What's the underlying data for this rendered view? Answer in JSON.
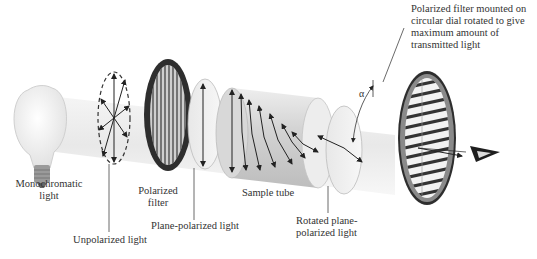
{
  "labels": {
    "monochromatic_light": [
      "Monochromatic",
      "light"
    ],
    "unpolarized_light": "Unpolarized light",
    "polarized_filter": [
      "Polarized",
      "filter"
    ],
    "plane_polarized_light": "Plane-polarized light",
    "sample_tube": "Sample tube",
    "rotated_plane_polarized_light": [
      "Rotated plane-",
      "polarized light"
    ],
    "analyzer_filter": [
      "Polarized filter mounted on",
      "circular dial rotated to give",
      "maximum amount of",
      "transmitted light"
    ],
    "angle_symbol": "α"
  },
  "colors": {
    "tube_gray": "#d9d9d9",
    "filter_ring": "#3a3a3a",
    "arrow": "#222222",
    "text": "#333333"
  }
}
